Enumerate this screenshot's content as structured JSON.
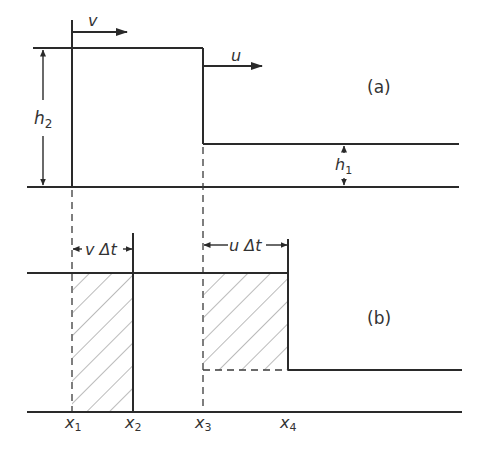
{
  "diagram": {
    "panels": [
      {
        "id": "a",
        "label": "(a)"
      },
      {
        "id": "b",
        "label": "(b)"
      }
    ],
    "velocity_labels": {
      "v": "v",
      "u": "u"
    },
    "depth_labels": {
      "h2_base": "h",
      "h2_sub": "2",
      "h1_base": "h",
      "h1_sub": "1"
    },
    "interval_labels": {
      "v_dt": "v Δt",
      "u_dt": "u Δt"
    },
    "x_labels": [
      {
        "base": "x",
        "sub": "1"
      },
      {
        "base": "x",
        "sub": "2"
      },
      {
        "base": "x",
        "sub": "3"
      },
      {
        "base": "x",
        "sub": "4"
      }
    ],
    "colors": {
      "line": "#2a2a2a",
      "hatch": "#777777",
      "text": "#333333"
    }
  }
}
